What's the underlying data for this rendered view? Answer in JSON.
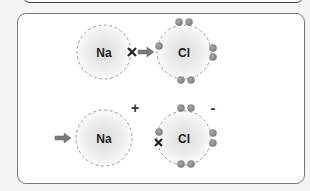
{
  "diagram": {
    "stage1": {
      "atom_left": {
        "symbol": "Na"
      },
      "atom_right": {
        "symbol": "Cl"
      },
      "transfer_marker": "X"
    },
    "stage2": {
      "atom_left": {
        "symbol": "Na",
        "charge": "+"
      },
      "atom_right": {
        "symbol": "Cl",
        "charge": "-"
      },
      "transferred_electron_marker": "X"
    },
    "colors": {
      "electron": "#8a8a8a",
      "arrow": "#7a7a7a",
      "atom_shell": "#9a9a9a",
      "atom_fill_center": "#e2e2e2"
    }
  }
}
